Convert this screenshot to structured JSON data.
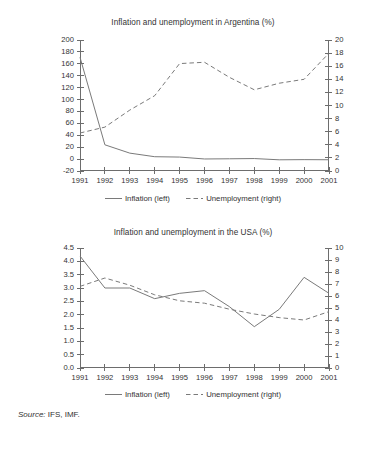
{
  "source": {
    "label": "Source:",
    "text": " IFS, IMF."
  },
  "legend": {
    "inflation": "Inflation (left)",
    "unemployment": "Unemployment (right)",
    "inflation_icon": "solid-line-swatch",
    "unemployment_icon": "dashed-line-swatch"
  },
  "colors": {
    "line": "#7a7a7a",
    "axis": "#6d6d6d",
    "text": "#333333",
    "background": "#ffffff"
  },
  "chart_data": [
    {
      "type": "line",
      "title": "Inflation and unemployment in Argentina (%)",
      "xlabel": "",
      "ylabel": "",
      "x": [
        1991,
        1992,
        1993,
        1994,
        1995,
        1996,
        1997,
        1998,
        1999,
        2000,
        2001
      ],
      "xticklabels": [
        "1991",
        "1992",
        "1993",
        "1994",
        "1995",
        "1996",
        "1997",
        "1998",
        "1999",
        "2000",
        "2001"
      ],
      "xlim": [
        1991,
        2001
      ],
      "grid": false,
      "legend_position": "bottom",
      "axes": [
        {
          "side": "left",
          "label": "",
          "ylim": [
            -20,
            200
          ],
          "ticks": [
            -20,
            0,
            20,
            40,
            60,
            80,
            100,
            120,
            140,
            160,
            180,
            200
          ],
          "ticklabels": [
            "-20",
            "0",
            "20",
            "40",
            "60",
            "80",
            "100",
            "120",
            "140",
            "160",
            "180",
            "200"
          ]
        },
        {
          "side": "right",
          "label": "",
          "ylim": [
            0,
            20
          ],
          "ticks": [
            0,
            2,
            4,
            6,
            8,
            10,
            12,
            14,
            16,
            18,
            20
          ],
          "ticklabels": [
            "0",
            "2",
            "4",
            "6",
            "8",
            "10",
            "12",
            "14",
            "16",
            "18",
            "20"
          ]
        }
      ],
      "series": [
        {
          "name": "Inflation (left)",
          "axis": "left",
          "style": "solid",
          "values": [
            171,
            24,
            10,
            4,
            3.4,
            0.2,
            0.5,
            0.9,
            -1.2,
            -0.9,
            -1.1
          ]
        },
        {
          "name": "Unemployment (right)",
          "axis": "right",
          "style": "dashed",
          "values": [
            5.8,
            6.7,
            9.3,
            11.5,
            16.4,
            16.6,
            14.3,
            12.4,
            13.4,
            14.0,
            18.0
          ]
        }
      ]
    },
    {
      "type": "line",
      "title": "Inflation and unemployment in the USA (%)",
      "xlabel": "",
      "ylabel": "",
      "x": [
        1991,
        1992,
        1993,
        1994,
        1995,
        1996,
        1997,
        1998,
        1999,
        2000,
        2001
      ],
      "xticklabels": [
        "1991",
        "1992",
        "1993",
        "1994",
        "1995",
        "1996",
        "1997",
        "1998",
        "1999",
        "2000",
        "2001"
      ],
      "xlim": [
        1991,
        2001
      ],
      "grid": false,
      "legend_position": "bottom",
      "axes": [
        {
          "side": "left",
          "label": "",
          "ylim": [
            0.0,
            4.5
          ],
          "ticks": [
            0.0,
            0.5,
            1.0,
            1.5,
            2.0,
            2.5,
            3.0,
            3.5,
            4.0,
            4.5
          ],
          "ticklabels": [
            "0.0",
            "0.5",
            "1.0",
            "1.5",
            "2.0",
            "2.5",
            "3.0",
            "3.5",
            "4.0",
            "4.5"
          ]
        },
        {
          "side": "right",
          "label": "",
          "ylim": [
            0,
            10
          ],
          "ticks": [
            0,
            1,
            2,
            3,
            4,
            5,
            6,
            7,
            8,
            9,
            10
          ],
          "ticklabels": [
            "0",
            "1",
            "2",
            "3",
            "4",
            "5",
            "6",
            "7",
            "8",
            "9",
            "10"
          ]
        }
      ],
      "series": [
        {
          "name": "Inflation (left)",
          "axis": "left",
          "style": "solid",
          "values": [
            4.2,
            3.0,
            3.0,
            2.6,
            2.8,
            2.9,
            2.3,
            1.55,
            2.2,
            3.4,
            2.8
          ]
        },
        {
          "name": "Unemployment (right)",
          "axis": "right",
          "style": "dashed",
          "values": [
            6.8,
            7.5,
            6.9,
            6.1,
            5.6,
            5.4,
            4.9,
            4.5,
            4.2,
            4.0,
            4.7
          ]
        }
      ]
    }
  ]
}
